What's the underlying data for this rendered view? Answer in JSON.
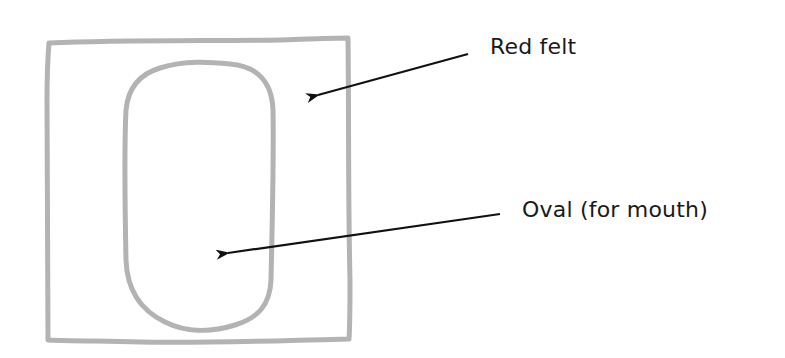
{
  "diagram": {
    "type": "craft-template",
    "colors": {
      "outline": "#b3b3b3",
      "arrow": "#111111",
      "text": "#1a1a1a",
      "background": "#ffffff"
    },
    "shapes": [
      {
        "id": "outer-square",
        "kind": "rectangle",
        "x": 47,
        "y": 40,
        "width": 302,
        "height": 300
      },
      {
        "id": "inner-oval",
        "kind": "rounded-oval",
        "x": 122,
        "y": 62,
        "width": 150,
        "height": 268
      }
    ],
    "labels": [
      {
        "id": "red-felt",
        "text": "Red felt",
        "points_to": "outer-square"
      },
      {
        "id": "oval",
        "text": "Oval (for mouth)",
        "points_to": "inner-oval"
      }
    ]
  }
}
